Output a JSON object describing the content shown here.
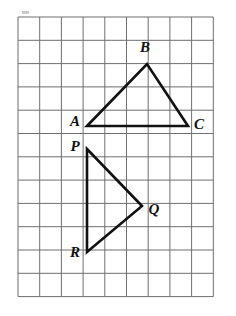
{
  "figure": {
    "background_color": "#ffffff",
    "stroke_color": "#111111",
    "grid_color": "#6f6f72",
    "grid": {
      "origin_x": 18,
      "origin_y": 17,
      "cell_width": 21.7,
      "cell_height": 23.3,
      "columns": 9,
      "rows": 12,
      "line_width": 1
    },
    "smudge": {
      "x": 22,
      "y": 11,
      "width": 7,
      "height": 3,
      "color": "#b9b9bd"
    },
    "shapes": [
      {
        "id": "triangle-abc",
        "name": "triangle-abc",
        "points": "87,126 147,64 188,126",
        "closed": true,
        "stroke_width": 2.6
      },
      {
        "id": "triangle-pqr",
        "name": "triangle-pqr",
        "points": "87,149 142,206 87,252",
        "closed": true,
        "stroke_width": 2.6
      }
    ],
    "vertex_labels": [
      {
        "id": "label-a",
        "text": "A",
        "x": 75,
        "y": 123
      },
      {
        "id": "label-b",
        "text": "B",
        "x": 145,
        "y": 49
      },
      {
        "id": "label-c",
        "text": "C",
        "x": 199,
        "y": 126
      },
      {
        "id": "label-p",
        "text": "P",
        "x": 75,
        "y": 148
      },
      {
        "id": "label-q",
        "text": "Q",
        "x": 154,
        "y": 211
      },
      {
        "id": "label-r",
        "text": "R",
        "x": 75,
        "y": 254
      }
    ]
  }
}
